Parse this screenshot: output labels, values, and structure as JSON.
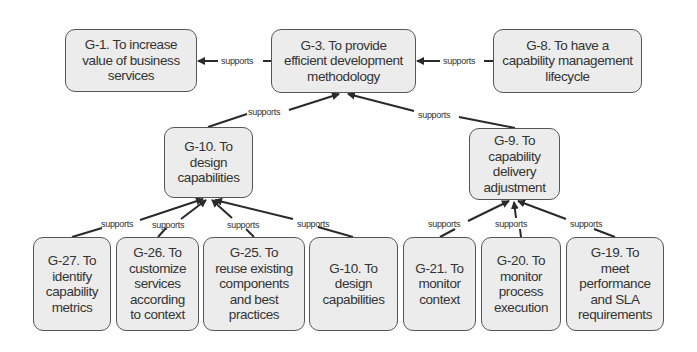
{
  "diagram": {
    "edge_label": "supports",
    "colors": {
      "node_fill": "#ececec",
      "node_border": "#555555",
      "text": "#333333",
      "edge": "#2a2a2a"
    },
    "nodes": {
      "g1": {
        "id": "G-1",
        "label": "G-1. To increase value of business services",
        "lines": [
          "G-1. To increase",
          "value of business",
          "services"
        ]
      },
      "g3": {
        "id": "G-3",
        "label": "G-3. To provide efficient development methodology",
        "lines": [
          "G-3. To provide",
          "efficient development",
          "methodology"
        ]
      },
      "g8": {
        "id": "G-8",
        "label": "G-8. To have a capability management lifecycle",
        "lines": [
          "G-8. To have a",
          "capability management",
          "lifecycle"
        ]
      },
      "g10": {
        "id": "G-10",
        "label": "G-10. To design capabilities",
        "lines": [
          "G-10. To",
          "design",
          "capabilities"
        ]
      },
      "g9": {
        "id": "G-9",
        "label": "G-9. To capability delivery adjustment",
        "lines": [
          "G-9. To",
          "capability",
          "delivery",
          "adjustment"
        ]
      },
      "g27": {
        "id": "G-27",
        "label": "G-27. To identify capability metrics",
        "lines": [
          "G-27. To",
          "identify",
          "capability",
          "metrics"
        ]
      },
      "g26": {
        "id": "G-26",
        "label": "G-26. To customize services according to context",
        "lines": [
          "G-26. To",
          "customize",
          "services",
          "according",
          "to context"
        ]
      },
      "g25": {
        "id": "G-25",
        "label": "G-25. To reuse existing components and best practices",
        "lines": [
          "G-25. To",
          "reuse existing",
          "components",
          "and best",
          "practices"
        ]
      },
      "g10b": {
        "id": "G-10",
        "label": "G-10. To design capabilities",
        "lines": [
          "G-10. To",
          "design",
          "capabilities"
        ]
      },
      "g21": {
        "id": "G-21",
        "label": "G-21. To monitor context",
        "lines": [
          "G-21. To",
          "monitor",
          "context"
        ]
      },
      "g20": {
        "id": "G-20",
        "label": "G-20. To monitor process execution",
        "lines": [
          "G-20. To",
          "monitor",
          "process",
          "execution"
        ]
      },
      "g19": {
        "id": "G-19",
        "label": "G-19. To meet performance and SLA requirements",
        "lines": [
          "G-19. To",
          "meet",
          "performance",
          "and SLA",
          "requirements"
        ]
      }
    },
    "edges": [
      {
        "from": "G-3",
        "to": "G-1",
        "label": "supports"
      },
      {
        "from": "G-8",
        "to": "G-3",
        "label": "supports"
      },
      {
        "from": "G-10",
        "to": "G-3",
        "label": "supports"
      },
      {
        "from": "G-9",
        "to": "G-3",
        "label": "supports"
      },
      {
        "from": "G-27",
        "to": "G-10",
        "label": "supports"
      },
      {
        "from": "G-26",
        "to": "G-10",
        "label": "supports"
      },
      {
        "from": "G-25",
        "to": "G-10",
        "label": "supports"
      },
      {
        "from": "G-10 (bottom)",
        "to": "G-10",
        "label": "supports"
      },
      {
        "from": "G-21",
        "to": "G-9",
        "label": "supports"
      },
      {
        "from": "G-20",
        "to": "G-9",
        "label": "supports"
      },
      {
        "from": "G-19",
        "to": "G-9",
        "label": "supports"
      }
    ]
  }
}
